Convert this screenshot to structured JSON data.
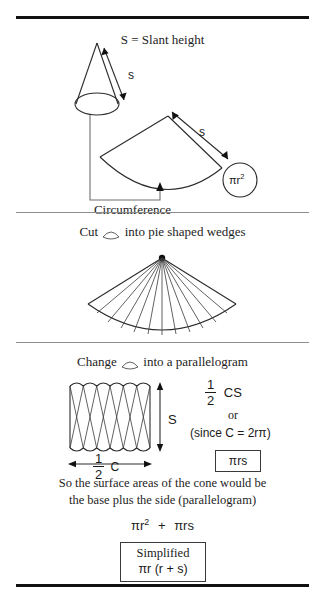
{
  "document": {
    "title": "Surface Area of a Cone",
    "background_color": "#ffffff",
    "ink_color": "#1a1a1a"
  },
  "rules": {
    "top_label": "top-rule",
    "divider1_label": "divider-rule-1",
    "divider2_label": "divider-rule-2",
    "bottom_label": "bottom-rule"
  },
  "panel1": {
    "heading": "S = Slant height",
    "cone_slant_label": "s",
    "sector_slant_label": "s",
    "base_area_label": "πr",
    "base_area_exponent": "2",
    "circumference_label": "Circumference"
  },
  "panel2": {
    "caption_before": "Cut",
    "caption_after": "into pie shaped wedges",
    "glyph_name": "cone-sector-glyph",
    "wedge_count": 12
  },
  "panel3": {
    "caption_before": "Change",
    "caption_after": "into a parallelogram",
    "glyph_name": "cone-sector-glyph",
    "height_label": "S",
    "width_numerator": "1",
    "width_denominator": "2",
    "width_symbol": "C",
    "area_numerator": "1",
    "area_denominator": "2",
    "area_symbol": "CS",
    "or_text": "or",
    "since_text": "(since C = 2rπ)",
    "result_boxed": "πrs",
    "wedge_count": 6
  },
  "conclusion": {
    "line1": "So the surface areas of the cone would be",
    "line2": "the base plus the side (parallelogram)",
    "expression_first": "πr",
    "expression_first_exp": "2",
    "expression_plus": "+",
    "expression_second": "πrs",
    "simplified_title": "Simplified",
    "simplified_formula": "πr (r + s)"
  }
}
